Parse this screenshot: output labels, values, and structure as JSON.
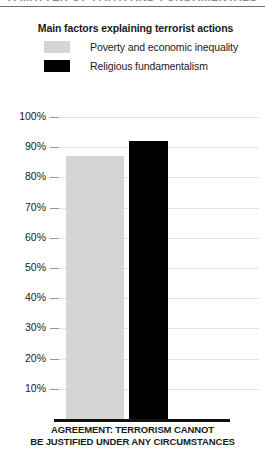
{
  "top_strip": {
    "cutoff_text": "A MATTER OF FAITH AND FUNDAMENTALS"
  },
  "legend": {
    "title": "Main factors explaining terrorist actions",
    "items": [
      {
        "label": "Poverty and economic inequality",
        "color": "#d5d5d5",
        "swatch_name": "legend-swatch-poverty"
      },
      {
        "label": "Religious fundamentalism",
        "color": "#000000",
        "swatch_name": "legend-swatch-fundamentalism"
      }
    ]
  },
  "caption": {
    "line1": "AGREEMENT: TERRORISM CANNOT",
    "line2": "BE JUSTIFIED UNDER ANY CIRCUMSTANCES"
  },
  "colors": {
    "series_poverty": "#d5d5d5",
    "series_fundamentalism": "#000000",
    "gridline": "#e3e3e3",
    "axis": "#111111",
    "text": "#1a1a1a"
  },
  "chart_data": {
    "type": "bar",
    "title": "Main factors explaining terrorist actions",
    "xlabel": "AGREEMENT: TERRORISM CANNOT BE JUSTIFIED UNDER ANY CIRCUMSTANCES",
    "ylabel": "",
    "ylim": [
      0,
      100
    ],
    "yticks": [
      100,
      90,
      80,
      70,
      60,
      50,
      40,
      30,
      20,
      10
    ],
    "ytick_labels": [
      "100%",
      "90%",
      "80%",
      "70%",
      "60%",
      "50%",
      "40%",
      "30%",
      "20%",
      "10%"
    ],
    "grid": true,
    "legend_position": "top",
    "categories": [
      "AGREEMENT: TERRORISM CANNOT BE JUSTIFIED UNDER ANY CIRCUMSTANCES"
    ],
    "series": [
      {
        "name": "Poverty and economic inequality",
        "values": [
          87
        ],
        "color": "#d5d5d5"
      },
      {
        "name": "Religious fundamentalism",
        "values": [
          92
        ],
        "color": "#000000"
      }
    ]
  }
}
